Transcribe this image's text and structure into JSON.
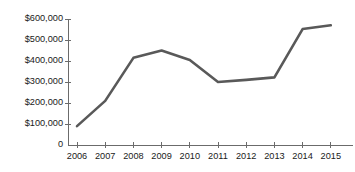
{
  "chart_data": {
    "type": "line",
    "title": "",
    "subtitle": "",
    "xlabel": "",
    "ylabel": "",
    "categories": [
      "2006",
      "2007",
      "2008",
      "2009",
      "2010",
      "2011",
      "2012",
      "2013",
      "2014",
      "2015"
    ],
    "values": [
      90000,
      210000,
      415000,
      450000,
      405000,
      300000,
      310000,
      322000,
      552000,
      570000
    ],
    "series": [
      {
        "name": "",
        "values": [
          90000,
          210000,
          415000,
          450000,
          405000,
          300000,
          310000,
          322000,
          552000,
          570000
        ]
      }
    ],
    "ylim": [
      0,
      600000
    ],
    "ytick_values": [
      0,
      100000,
      200000,
      300000,
      400000,
      500000,
      600000
    ],
    "ytick_labels": [
      "0",
      "$100,000",
      "$200,000",
      "$300,000",
      "$400,000",
      "$500,000",
      "$600,000"
    ],
    "xtick_labels": [
      "2006",
      "2007",
      "2008",
      "2009",
      "2010",
      "2011",
      "2012",
      "2013",
      "2014",
      "2015"
    ],
    "grid": false,
    "legend": "none",
    "line_color": "#595959",
    "axis_color": "#6b6b6b",
    "text_color": "#1a1a1a",
    "background_color": "#ffffff",
    "markers": false,
    "annotations": []
  },
  "plot_geometry": {
    "x_first_tick": 77,
    "x_tick_spacing": 28.2,
    "y_baseline": 145,
    "y_per_100k": 21
  }
}
